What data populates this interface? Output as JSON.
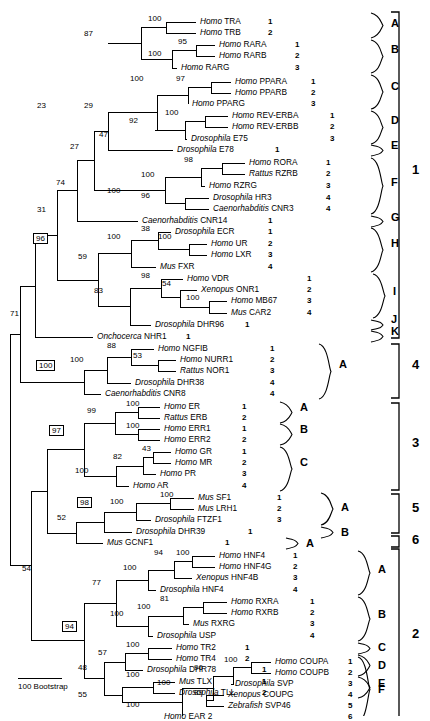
{
  "figure": {
    "type": "phylogenetic-tree",
    "scale_bar_label": "100 Bootstrap"
  },
  "taxa": [
    {
      "genus": "Homo",
      "gene": "TRA",
      "num": "1",
      "y": 22,
      "branch_x": 196,
      "lbl_x": 200,
      "num_x": 268
    },
    {
      "genus": "Homo",
      "gene": "TRB",
      "num": "2",
      "y": 33,
      "branch_x": 196,
      "lbl_x": 200,
      "num_x": 268
    },
    {
      "genus": "Homo",
      "gene": "RARA",
      "num": "1",
      "y": 45,
      "branch_x": 215,
      "lbl_x": 219,
      "num_x": 295
    },
    {
      "genus": "Homo",
      "gene": "RARB",
      "num": "2",
      "y": 56,
      "branch_x": 215,
      "lbl_x": 219,
      "num_x": 295
    },
    {
      "genus": "Homo",
      "gene": "RARG",
      "num": "3",
      "y": 68,
      "branch_x": 177,
      "lbl_x": 181,
      "num_x": 295
    },
    {
      "genus": "Homo",
      "gene": "PPARA",
      "num": "1",
      "y": 82,
      "branch_x": 231,
      "lbl_x": 235,
      "num_x": 311
    },
    {
      "genus": "Homo",
      "gene": "PPARB",
      "num": "2",
      "y": 93,
      "branch_x": 231,
      "lbl_x": 235,
      "num_x": 311
    },
    {
      "genus": "Homo",
      "gene": "PPARG",
      "num": "3",
      "y": 104,
      "branch_x": 188,
      "lbl_x": 192,
      "num_x": 311
    },
    {
      "genus": "Homo",
      "gene": "REV-ERBA",
      "num": "1",
      "y": 116,
      "branch_x": 228,
      "lbl_x": 232,
      "num_x": 330
    },
    {
      "genus": "Homo",
      "gene": "REV-ERBB",
      "num": "2",
      "y": 127,
      "branch_x": 228,
      "lbl_x": 232,
      "num_x": 330
    },
    {
      "genus": "Drosophila",
      "gene": "E75",
      "num": "3",
      "y": 139,
      "branch_x": 187,
      "lbl_x": 191,
      "num_x": 330
    },
    {
      "genus": "Drosophila",
      "gene": "E78",
      "num": "1",
      "y": 150,
      "branch_x": 173,
      "lbl_x": 177,
      "num_x": 275
    },
    {
      "genus": "Homo",
      "gene": "RORA",
      "num": "1",
      "y": 163,
      "branch_x": 245,
      "lbl_x": 249,
      "num_x": 326
    },
    {
      "genus": "Rattus",
      "gene": "RZRB",
      "num": "2",
      "y": 174,
      "branch_x": 245,
      "lbl_x": 249,
      "num_x": 326
    },
    {
      "genus": "Homo",
      "gene": "RZRG",
      "num": "3",
      "y": 186,
      "branch_x": 205,
      "lbl_x": 209,
      "num_x": 326
    },
    {
      "genus": "Drosophila",
      "gene": "HR3",
      "num": "4",
      "y": 198,
      "branch_x": 209,
      "lbl_x": 213,
      "num_x": 326
    },
    {
      "genus": "Caenorhabditis",
      "gene": "CNR3",
      "num": "4",
      "y": 209,
      "branch_x": 209,
      "lbl_x": 213,
      "num_x": 326
    },
    {
      "genus": "Caenorhabditis",
      "gene": "CNR14",
      "num": "1",
      "y": 221,
      "branch_x": 138,
      "lbl_x": 142,
      "num_x": 268
    },
    {
      "genus": "Drosophila",
      "gene": "ECR",
      "num": "1",
      "y": 232,
      "branch_x": 171,
      "lbl_x": 175,
      "num_x": 268
    },
    {
      "genus": "Homo",
      "gene": "UR",
      "num": "2",
      "y": 244,
      "branch_x": 207,
      "lbl_x": 211,
      "num_x": 268
    },
    {
      "genus": "Homo",
      "gene": "LXR",
      "num": "3",
      "y": 255,
      "branch_x": 207,
      "lbl_x": 211,
      "num_x": 268
    },
    {
      "genus": "Mus",
      "gene": "FXR",
      "num": "4",
      "y": 267,
      "branch_x": 156,
      "lbl_x": 160,
      "num_x": 268
    },
    {
      "genus": "Homo",
      "gene": "VDR",
      "num": "1",
      "y": 279,
      "branch_x": 183,
      "lbl_x": 187,
      "num_x": 307
    },
    {
      "genus": "Xenopus",
      "gene": "ONR1",
      "num": "2",
      "y": 290,
      "branch_x": 197,
      "lbl_x": 201,
      "num_x": 307
    },
    {
      "genus": "Homo",
      "gene": "MB67",
      "num": "3",
      "y": 301,
      "branch_x": 227,
      "lbl_x": 231,
      "num_x": 307
    },
    {
      "genus": "Mus",
      "gene": "CAR2",
      "num": "4",
      "y": 313,
      "branch_x": 227,
      "lbl_x": 231,
      "num_x": 307
    },
    {
      "genus": "Drosophila",
      "gene": "DHR96",
      "num": "1",
      "y": 325,
      "branch_x": 151,
      "lbl_x": 155,
      "num_x": 245
    },
    {
      "genus": "Onchocerca",
      "gene": "NHR1",
      "num": "1",
      "y": 337,
      "branch_x": 93,
      "lbl_x": 97,
      "num_x": 186
    },
    {
      "genus": "Homo",
      "gene": "NGFIB",
      "num": "1",
      "y": 349,
      "branch_x": 154,
      "lbl_x": 158,
      "num_x": 270
    },
    {
      "genus": "Homo",
      "gene": "NURR1",
      "num": "2",
      "y": 360,
      "branch_x": 176,
      "lbl_x": 180,
      "num_x": 270
    },
    {
      "genus": "Rattus",
      "gene": "NOR1",
      "num": "3",
      "y": 371,
      "branch_x": 176,
      "lbl_x": 180,
      "num_x": 270
    },
    {
      "genus": "Drosophila",
      "gene": "DHR38",
      "num": "4",
      "y": 383,
      "branch_x": 131,
      "lbl_x": 135,
      "num_x": 270
    },
    {
      "genus": "Caenorhabditis",
      "gene": "CNR8",
      "num": "4",
      "y": 394,
      "branch_x": 101,
      "lbl_x": 105,
      "num_x": 270
    },
    {
      "genus": "Homo",
      "gene": "ER",
      "num": "1",
      "y": 407,
      "branch_x": 160,
      "lbl_x": 164,
      "num_x": 242
    },
    {
      "genus": "Rattus",
      "gene": "ERB",
      "num": "2",
      "y": 418,
      "branch_x": 160,
      "lbl_x": 164,
      "num_x": 242
    },
    {
      "genus": "Homo",
      "gene": "ERR1",
      "num": "1",
      "y": 429,
      "branch_x": 160,
      "lbl_x": 164,
      "num_x": 242
    },
    {
      "genus": "Homo",
      "gene": "ERR2",
      "num": "2",
      "y": 440,
      "branch_x": 160,
      "lbl_x": 164,
      "num_x": 242
    },
    {
      "genus": "Homo",
      "gene": "GR",
      "num": "1",
      "y": 452,
      "branch_x": 171,
      "lbl_x": 175,
      "num_x": 242
    },
    {
      "genus": "Homo",
      "gene": "MR",
      "num": "2",
      "y": 463,
      "branch_x": 171,
      "lbl_x": 175,
      "num_x": 242
    },
    {
      "genus": "Homo",
      "gene": "PR",
      "num": "3",
      "y": 474,
      "branch_x": 156,
      "lbl_x": 160,
      "num_x": 242
    },
    {
      "genus": "Homo",
      "gene": "AR",
      "num": "4",
      "y": 486,
      "branch_x": 129,
      "lbl_x": 133,
      "num_x": 242
    },
    {
      "genus": "Mus",
      "gene": "SF1",
      "num": "1",
      "y": 498,
      "branch_x": 194,
      "lbl_x": 198,
      "num_x": 277
    },
    {
      "genus": "Mus",
      "gene": "LRH1",
      "num": "2",
      "y": 509,
      "branch_x": 194,
      "lbl_x": 198,
      "num_x": 277
    },
    {
      "genus": "Drosophila",
      "gene": "FTZF1",
      "num": "3",
      "y": 520,
      "branch_x": 151,
      "lbl_x": 155,
      "num_x": 277
    },
    {
      "genus": "Drosophila",
      "gene": "DHR39",
      "num": "1",
      "y": 532,
      "branch_x": 132,
      "lbl_x": 136,
      "num_x": 248
    },
    {
      "genus": "Mus",
      "gene": "GCNF1",
      "num": "1",
      "y": 543,
      "branch_x": 103,
      "lbl_x": 107,
      "num_x": 225
    },
    {
      "genus": "Homo",
      "gene": "HNF4",
      "num": "1",
      "y": 556,
      "branch_x": 215,
      "lbl_x": 219,
      "num_x": 293
    },
    {
      "genus": "Homo",
      "gene": "HNF4G",
      "num": "2",
      "y": 567,
      "branch_x": 215,
      "lbl_x": 219,
      "num_x": 293
    },
    {
      "genus": "Xenopus",
      "gene": "HNF4B",
      "num": "3",
      "y": 578,
      "branch_x": 192,
      "lbl_x": 196,
      "num_x": 293
    },
    {
      "genus": "Drosophila",
      "gene": "HNF4",
      "num": "4",
      "y": 590,
      "branch_x": 156,
      "lbl_x": 160,
      "num_x": 293
    },
    {
      "genus": "Homo",
      "gene": "RXRA",
      "num": "1",
      "y": 602,
      "branch_x": 227,
      "lbl_x": 231,
      "num_x": 310
    },
    {
      "genus": "Homo",
      "gene": "RXRB",
      "num": "2",
      "y": 613,
      "branch_x": 227,
      "lbl_x": 231,
      "num_x": 310
    },
    {
      "genus": "Mus",
      "gene": "RXRG",
      "num": "3",
      "y": 624,
      "branch_x": 189,
      "lbl_x": 193,
      "num_x": 310
    },
    {
      "genus": "Drosophila",
      "gene": "USP",
      "num": "4",
      "y": 636,
      "branch_x": 153,
      "lbl_x": 157,
      "num_x": 310
    },
    {
      "genus": "Homo",
      "gene": "TR2",
      "num": "1",
      "y": 648,
      "branch_x": 172,
      "lbl_x": 176,
      "num_x": 245
    },
    {
      "genus": "Homo",
      "gene": "TR4",
      "num": "2",
      "y": 659,
      "branch_x": 172,
      "lbl_x": 176,
      "num_x": 245
    },
    {
      "genus": "Drosophila",
      "gene": "DHR78",
      "num": "1",
      "y": 670,
      "branch_x": 143,
      "lbl_x": 147,
      "num_x": 262
    },
    {
      "genus": "Mus",
      "gene": "TLX",
      "num": "1",
      "y": 682,
      "branch_x": 175,
      "lbl_x": 179,
      "num_x": 262
    },
    {
      "genus": "Drosophila",
      "gene": "TLL",
      "num": "2",
      "y": 693,
      "branch_x": 175,
      "lbl_x": 179,
      "num_x": 262
    }
  ],
  "taxa_right": [
    {
      "genus": "Homo",
      "gene": "COUPA",
      "num": "1",
      "y": 662,
      "branch_x": 271,
      "lbl_x": 275,
      "num_x": 348
    },
    {
      "genus": "Homo",
      "gene": "COUPB",
      "num": "2",
      "y": 673,
      "branch_x": 271,
      "lbl_x": 275,
      "num_x": 348
    },
    {
      "genus": "Drosophila",
      "gene": "SVP",
      "num": "3",
      "y": 684,
      "branch_x": 231,
      "lbl_x": 235,
      "num_x": 348
    },
    {
      "genus": "Xenopus",
      "gene": "COUPG",
      "num": "4",
      "y": 695,
      "branch_x": 224,
      "lbl_x": 228,
      "num_x": 348
    },
    {
      "genus": "Zebrafish",
      "gene": "SVP46",
      "num": "5",
      "y": 706,
      "branch_x": 224,
      "lbl_x": 228,
      "num_x": 348
    },
    {
      "genus": "Homo",
      "gene": "EAR 2",
      "num": "6",
      "y": 717,
      "branch_x": 160,
      "lbl_x": 164,
      "num_x": 348
    }
  ],
  "bootstraps": [
    {
      "v": "100",
      "x": 148,
      "y": 14,
      "boxed": false
    },
    {
      "v": "87",
      "x": 84,
      "y": 29,
      "boxed": false
    },
    {
      "v": "95",
      "x": 178,
      "y": 37,
      "boxed": false
    },
    {
      "v": "100",
      "x": 148,
      "y": 49,
      "boxed": false
    },
    {
      "v": "100",
      "x": 130,
      "y": 74,
      "boxed": false
    },
    {
      "v": "97",
      "x": 176,
      "y": 74,
      "boxed": false
    },
    {
      "v": "23",
      "x": 37,
      "y": 101,
      "boxed": false
    },
    {
      "v": "29",
      "x": 84,
      "y": 101,
      "boxed": false
    },
    {
      "v": "100",
      "x": 165,
      "y": 108,
      "boxed": false
    },
    {
      "v": "92",
      "x": 129,
      "y": 116,
      "boxed": false
    },
    {
      "v": "47",
      "x": 99,
      "y": 130,
      "boxed": false
    },
    {
      "v": "27",
      "x": 70,
      "y": 142,
      "boxed": false
    },
    {
      "v": "98",
      "x": 184,
      "y": 155,
      "boxed": false
    },
    {
      "v": "100",
      "x": 141,
      "y": 170,
      "boxed": false
    },
    {
      "v": "74",
      "x": 56,
      "y": 178,
      "boxed": false
    },
    {
      "v": "100",
      "x": 107,
      "y": 186,
      "boxed": false
    },
    {
      "v": "96",
      "x": 141,
      "y": 191,
      "boxed": false
    },
    {
      "v": "31",
      "x": 37,
      "y": 205,
      "boxed": false
    },
    {
      "v": "38",
      "x": 141,
      "y": 224,
      "boxed": false
    },
    {
      "v": "100",
      "x": 107,
      "y": 232,
      "boxed": false
    },
    {
      "v": "100",
      "x": 158,
      "y": 232,
      "boxed": false
    },
    {
      "v": "96",
      "x": 33,
      "y": 233,
      "boxed": true
    },
    {
      "v": "59",
      "x": 78,
      "y": 252,
      "boxed": false
    },
    {
      "v": "98",
      "x": 141,
      "y": 271,
      "boxed": false
    },
    {
      "v": "54",
      "x": 162,
      "y": 279,
      "boxed": false
    },
    {
      "v": "83",
      "x": 94,
      "y": 286,
      "boxed": false
    },
    {
      "v": "100",
      "x": 186,
      "y": 293,
      "boxed": false
    },
    {
      "v": "71",
      "x": 10,
      "y": 309,
      "boxed": false
    },
    {
      "v": "88",
      "x": 107,
      "y": 341,
      "boxed": false
    },
    {
      "v": "53",
      "x": 133,
      "y": 351,
      "boxed": false
    },
    {
      "v": "100",
      "x": 70,
      "y": 355,
      "boxed": false
    },
    {
      "v": "100",
      "x": 36,
      "y": 360,
      "boxed": true
    },
    {
      "v": "100",
      "x": 126,
      "y": 399,
      "boxed": false
    },
    {
      "v": "99",
      "x": 87,
      "y": 406,
      "boxed": false
    },
    {
      "v": "100",
      "x": 126,
      "y": 421,
      "boxed": false
    },
    {
      "v": "97",
      "x": 49,
      "y": 425,
      "boxed": true
    },
    {
      "v": "43",
      "x": 142,
      "y": 444,
      "boxed": false
    },
    {
      "v": "82",
      "x": 113,
      "y": 452,
      "boxed": false
    },
    {
      "v": "100",
      "x": 75,
      "y": 466,
      "boxed": false
    },
    {
      "v": "100",
      "x": 160,
      "y": 490,
      "boxed": false
    },
    {
      "v": "100",
      "x": 110,
      "y": 497,
      "boxed": false
    },
    {
      "v": "98",
      "x": 77,
      "y": 497,
      "boxed": true
    },
    {
      "v": "52",
      "x": 57,
      "y": 513,
      "boxed": false
    },
    {
      "v": "100",
      "x": 176,
      "y": 548,
      "boxed": false
    },
    {
      "v": "94",
      "x": 154,
      "y": 548,
      "boxed": false
    },
    {
      "v": "100",
      "x": 123,
      "y": 563,
      "boxed": false
    },
    {
      "v": "54",
      "x": 22,
      "y": 564,
      "boxed": false
    },
    {
      "v": "77",
      "x": 92,
      "y": 578,
      "boxed": false
    },
    {
      "v": "81",
      "x": 160,
      "y": 594,
      "boxed": false
    },
    {
      "v": "100",
      "x": 137,
      "y": 602,
      "boxed": false
    },
    {
      "v": "100",
      "x": 110,
      "y": 609,
      "boxed": false
    },
    {
      "v": "94",
      "x": 62,
      "y": 621,
      "boxed": true
    },
    {
      "v": "100",
      "x": 126,
      "y": 640,
      "boxed": false
    },
    {
      "v": "57",
      "x": 98,
      "y": 648,
      "boxed": false
    },
    {
      "v": "100",
      "x": 126,
      "y": 670,
      "boxed": false
    },
    {
      "v": "48",
      "x": 78,
      "y": 663,
      "boxed": false
    },
    {
      "v": "100",
      "x": 224,
      "y": 655,
      "boxed": false
    },
    {
      "v": "96",
      "x": 194,
      "y": 663,
      "boxed": false
    },
    {
      "v": "55",
      "x": 78,
      "y": 690,
      "boxed": false
    },
    {
      "v": "100",
      "x": 157,
      "y": 678,
      "boxed": false
    },
    {
      "v": "89",
      "x": 194,
      "y": 688,
      "boxed": false
    },
    {
      "v": "100",
      "x": 126,
      "y": 700,
      "boxed": false
    }
  ],
  "subgroups": [
    {
      "label": "A",
      "x": 391,
      "y": 24,
      "brace_top": 13,
      "brace_bot": 38
    },
    {
      "label": "B",
      "x": 391,
      "y": 50,
      "brace_top": 40,
      "brace_bot": 73
    },
    {
      "label": "C",
      "x": 391,
      "y": 87,
      "brace_top": 75,
      "brace_bot": 109
    },
    {
      "label": "D",
      "x": 391,
      "y": 121,
      "brace_top": 111,
      "brace_bot": 144
    },
    {
      "label": "E",
      "x": 391,
      "y": 146,
      "brace_top": 145,
      "brace_bot": 156
    },
    {
      "label": "F",
      "x": 391,
      "y": 183,
      "brace_top": 158,
      "brace_bot": 214
    },
    {
      "label": "G",
      "x": 391,
      "y": 218,
      "brace_top": 216,
      "brace_bot": 227
    },
    {
      "label": "H",
      "x": 391,
      "y": 244,
      "brace_top": 228,
      "brace_bot": 272
    },
    {
      "label": "I",
      "x": 393,
      "y": 292,
      "brace_top": 274,
      "brace_bot": 318
    },
    {
      "label": "J",
      "x": 391,
      "y": 320,
      "brace_top": 320,
      "brace_bot": 330
    },
    {
      "label": "K",
      "x": 391,
      "y": 332,
      "brace_top": 331,
      "brace_bot": 342
    },
    {
      "label": "A",
      "x": 339,
      "y": 365,
      "brace_top": 344,
      "brace_bot": 399
    },
    {
      "label": "A",
      "x": 300,
      "y": 408,
      "brace_top": 402,
      "brace_bot": 423
    },
    {
      "label": "B",
      "x": 300,
      "y": 430,
      "brace_top": 424,
      "brace_bot": 445
    },
    {
      "label": "C",
      "x": 300,
      "y": 463,
      "brace_top": 447,
      "brace_bot": 491
    },
    {
      "label": "A",
      "x": 341,
      "y": 508,
      "brace_top": 493,
      "brace_bot": 525
    },
    {
      "label": "B",
      "x": 341,
      "y": 533,
      "brace_top": 527,
      "brace_bot": 538
    },
    {
      "label": "A",
      "x": 306,
      "y": 544,
      "brace_top": 538,
      "brace_bot": 549
    },
    {
      "label": "A",
      "x": 378,
      "y": 570,
      "brace_top": 551,
      "brace_bot": 595
    },
    {
      "label": "B",
      "x": 378,
      "y": 615,
      "brace_top": 597,
      "brace_bot": 641
    },
    {
      "label": "C",
      "x": 378,
      "y": 648,
      "brace_top": 643,
      "brace_bot": 654
    },
    {
      "label": "D",
      "x": 378,
      "y": 666,
      "brace_top": 655,
      "brace_bot": 676
    },
    {
      "label": "E",
      "x": 378,
      "y": 684,
      "brace_top": 677,
      "brace_bot": 698
    },
    {
      "label": "F",
      "x": 378,
      "y": 690,
      "brace_top": 657,
      "brace_bot": 722
    }
  ],
  "classes": [
    {
      "label": "1",
      "x": 412,
      "y": 170,
      "top": 12,
      "bot": 338
    },
    {
      "label": "4",
      "x": 412,
      "y": 365,
      "top": 344,
      "bot": 398
    },
    {
      "label": "3",
      "x": 412,
      "y": 443,
      "top": 403,
      "bot": 490
    },
    {
      "label": "5",
      "x": 412,
      "y": 508,
      "top": 494,
      "bot": 533
    },
    {
      "label": "6",
      "x": 412,
      "y": 540,
      "top": 536,
      "bot": 547
    },
    {
      "label": "2",
      "x": 412,
      "y": 634,
      "top": 549,
      "bot": 722
    }
  ],
  "colors": {
    "line": "#000000",
    "background": "#ffffff"
  }
}
